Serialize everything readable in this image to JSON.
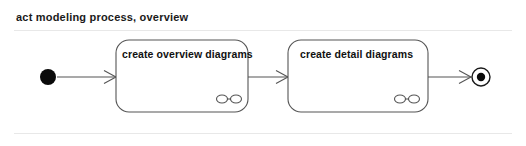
{
  "diagram": {
    "title": "act modeling process, overview",
    "kind": "uml-activity-diagram",
    "background_color": "#ffffff",
    "line_color": "#555555",
    "text_color": "#111111",
    "divider_color": "#e8e8e8",
    "nodes": [
      {
        "id": "start",
        "type": "initial-node",
        "icon_name": "filled-circle-icon",
        "label": "",
        "cx": 48,
        "cy": 77,
        "r": 8
      },
      {
        "id": "action-0",
        "type": "call-behavior-action",
        "label": "create overview diagrams",
        "x": 116,
        "y": 40,
        "width": 132,
        "height": 72,
        "rake_icon": "subactivity-rake-icon"
      },
      {
        "id": "action-1",
        "type": "call-behavior-action",
        "label": "create detail diagrams",
        "x": 288,
        "y": 40,
        "width": 140,
        "height": 72,
        "rake_icon": "subactivity-rake-icon"
      },
      {
        "id": "end",
        "type": "final-node",
        "icon_name": "bullseye-icon",
        "label": "",
        "cx": 481,
        "cy": 77,
        "r_outer": 9,
        "r_inner": 4
      }
    ],
    "edges": [
      {
        "id": "edge-0",
        "from": "start",
        "to": "action-0",
        "label": "",
        "x1": 57,
        "x2": 116,
        "y": 77
      },
      {
        "id": "edge-1",
        "from": "action-0",
        "to": "action-1",
        "label": "",
        "x1": 248,
        "x2": 288,
        "y": 77
      },
      {
        "id": "edge-2",
        "from": "action-1",
        "to": "end",
        "label": "",
        "x1": 428,
        "x2": 471,
        "y": 77
      }
    ]
  }
}
